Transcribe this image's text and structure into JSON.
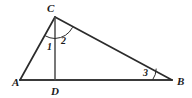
{
  "figure": {
    "background_color": "#ffffff",
    "stroke_color": "#2b2b2b",
    "label_color": "#1a1a1a",
    "width": 192,
    "height": 98
  },
  "vertices": [
    {
      "id": "A",
      "label": "A",
      "x": 20,
      "y": 80,
      "label_x": 12,
      "label_y": 86
    },
    {
      "id": "B",
      "label": "B",
      "x": 172,
      "y": 80,
      "label_x": 177,
      "label_y": 85
    },
    {
      "id": "C",
      "label": "C",
      "x": 55,
      "y": 17,
      "label_x": 47,
      "label_y": 12
    },
    {
      "id": "D",
      "label": "D",
      "x": 55,
      "y": 80,
      "label_x": 51,
      "label_y": 94
    }
  ],
  "segments": [
    {
      "id": "AB",
      "from": "A",
      "to": "B",
      "x1": 20,
      "y1": 80,
      "x2": 172,
      "y2": 80
    },
    {
      "id": "AC",
      "from": "A",
      "to": "C",
      "x1": 20,
      "y1": 80,
      "x2": 55,
      "y2": 17
    },
    {
      "id": "CB",
      "from": "C",
      "to": "B",
      "x1": 55,
      "y1": 17,
      "x2": 172,
      "y2": 80
    },
    {
      "id": "CD",
      "from": "C",
      "to": "D",
      "x1": 55,
      "y1": 17,
      "x2": 55,
      "y2": 80
    }
  ],
  "angles": [
    {
      "id": "angle-1",
      "label": "1",
      "at_vertex": "C",
      "between": "CA and CD",
      "label_x": 47,
      "label_y": 49,
      "arc_path": "M 44.5 35.2 A 21 21 0 0 0 55 38"
    },
    {
      "id": "angle-2",
      "label": "2",
      "at_vertex": "C",
      "between": "CD and CB",
      "label_x": 61,
      "label_y": 43,
      "arc_path": "M 55 38 A 21 21 0 0 0 72.5 27.5"
    },
    {
      "id": "angle-3",
      "label": "3",
      "at_vertex": "B",
      "between": "BC and BA",
      "label_x": 143,
      "label_y": 75,
      "arc_path": "M 152 80 A 20 20 0 0 0 155.7 68.5"
    }
  ]
}
